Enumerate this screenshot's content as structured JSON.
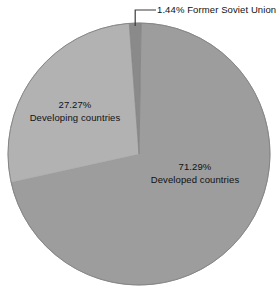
{
  "chart_data": {
    "type": "pie",
    "title": "",
    "subtitle": "",
    "xlabel": "",
    "ylabel": "",
    "legend_position": "none",
    "grid": false,
    "unit": "%",
    "categories": [
      "Developed countries",
      "Developing countries",
      "Former Soviet Union"
    ],
    "values": [
      71.29,
      27.27,
      1.44
    ],
    "slices": [
      {
        "label": "Developed countries",
        "value": 71.29,
        "pct_text": "71.29%",
        "color": "#9d9d9d",
        "label_placement": "inside"
      },
      {
        "label": "Developing countries",
        "value": 27.27,
        "pct_text": "27.27%",
        "color": "#b2b2b2",
        "label_placement": "inside"
      },
      {
        "label": "Former Soviet Union",
        "value": 1.44,
        "pct_text": "1.44%",
        "color": "#8a8a8a",
        "label_placement": "outside-leader"
      }
    ]
  },
  "figure": {
    "background": "#ffffff",
    "text_color": "#111111",
    "outline_color": "#7d7d7d",
    "leader_color": "#3a3a3a"
  },
  "labels": {
    "developed": {
      "pct": "71.29%",
      "name": "Developed countries"
    },
    "developing": {
      "pct": "27.27%",
      "name": "Developing countries"
    },
    "soviet": {
      "pct": "1.44%",
      "name": " Former Soviet Union"
    }
  }
}
